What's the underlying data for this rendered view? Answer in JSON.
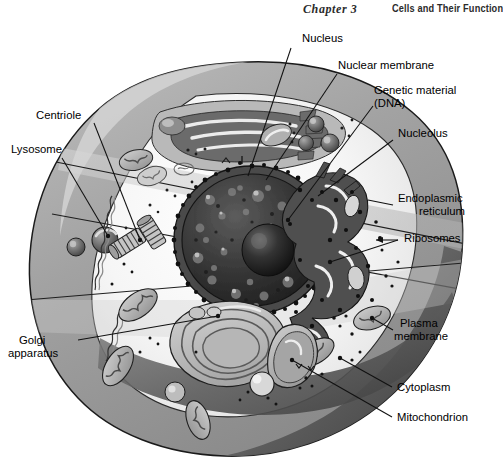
{
  "header": {
    "chapter": "Chapter 3",
    "title": "Cells and Their Function"
  },
  "figure": {
    "palette": {
      "background": "#ffffff",
      "cytoplasm_light": "#f2f2f2",
      "membrane_gray": "#9a9a9a",
      "membrane_dark": "#6e6e6e",
      "membrane_darkest": "#3d3d3d",
      "organelle_mid": "#b4b4b4",
      "organelle_dark": "#555555",
      "nucleus_dark": "#2e2e2e",
      "nucleolus": "#1a1a1a",
      "outline": "#1a1a1a",
      "label_text": "#000000"
    }
  },
  "labels": [
    {
      "id": "nucleus",
      "text": "Nucleus",
      "line2": ""
    },
    {
      "id": "nuclear-membrane",
      "text": "Nuclear membrane",
      "line2": ""
    },
    {
      "id": "genetic-material",
      "text": "Genetic material",
      "line2": "(DNA)"
    },
    {
      "id": "nucleolus",
      "text": "Nucleolus",
      "line2": ""
    },
    {
      "id": "endoplasmic-reticulum",
      "text": "Endoplasmic",
      "line2": "reticulum"
    },
    {
      "id": "ribosomes",
      "text": "Ribosomes",
      "line2": ""
    },
    {
      "id": "plasma-membrane",
      "text": "Plasma",
      "line2": "membrane"
    },
    {
      "id": "cytoplasm",
      "text": "Cytoplasm",
      "line2": ""
    },
    {
      "id": "mitochondrion",
      "text": "Mitochondrion",
      "line2": ""
    },
    {
      "id": "golgi-apparatus",
      "text": "Golgi",
      "line2": "apparatus"
    },
    {
      "id": "lysosome",
      "text": "Lysosome",
      "line2": ""
    },
    {
      "id": "centriole",
      "text": "Centriole",
      "line2": ""
    }
  ]
}
